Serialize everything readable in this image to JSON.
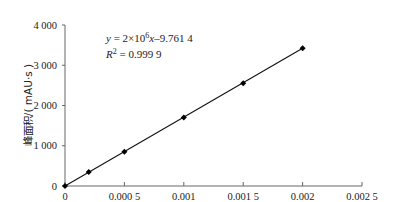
{
  "chart_data": {
    "type": "scatter",
    "title": "",
    "xlabel": "",
    "ylabel": "峰面积/( mAU·s )",
    "xlim": [
      0,
      0.0025
    ],
    "ylim": [
      0,
      4000
    ],
    "grid": false,
    "x_ticks": [
      "0",
      "0.000 5",
      "0.001",
      "0.001 5",
      "0.002",
      "0.002 5"
    ],
    "x_tick_values": [
      0,
      0.0005,
      0.001,
      0.0015,
      0.002,
      0.0025
    ],
    "y_ticks": [
      "0",
      "1 000",
      "2 000",
      "3 000",
      "4 000"
    ],
    "y_tick_values": [
      0,
      1000,
      2000,
      3000,
      4000
    ],
    "series": [
      {
        "name": "peak area",
        "marker": "diamond",
        "x": [
          0,
          0.0002,
          0.0005,
          0.001,
          0.0015,
          0.002
        ],
        "y": [
          0,
          350,
          850,
          1700,
          2550,
          3420
        ]
      }
    ],
    "fit_line": {
      "x": [
        0,
        0.002
      ],
      "y": [
        0,
        3420
      ]
    },
    "annotations": {
      "equation_prefix": "y = 2×10",
      "equation_exp": "6",
      "equation_suffix": "x–9.761 4",
      "r2_prefix": "R",
      "r2_exp": "2",
      "r2_suffix": " = 0.999 9"
    }
  }
}
